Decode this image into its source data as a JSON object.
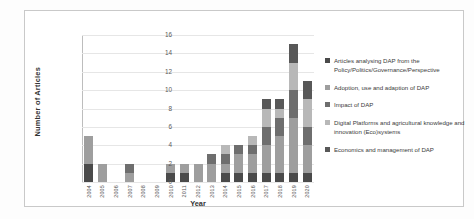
{
  "chart_data": {
    "type": "bar",
    "stacked": true,
    "title": "",
    "xlabel": "Year",
    "ylabel": "Number of Articles",
    "ylim": [
      0,
      16
    ],
    "yticks": [
      0,
      2,
      4,
      6,
      8,
      10,
      12,
      14,
      16
    ],
    "grid": true,
    "legend_position": "right",
    "categories": [
      "2004",
      "2005",
      "2006",
      "2007",
      "2008",
      "2009",
      "2010",
      "2011",
      "2012",
      "2013",
      "2014",
      "2015",
      "2016",
      "2017",
      "2018",
      "2019",
      "2020"
    ],
    "series": [
      {
        "name": "Articles analysing DAP from the Policy/Politics/Governance/Perspective",
        "color": "#4a4a4a",
        "values": [
          2,
          0,
          0,
          0,
          0,
          0,
          1,
          1,
          0,
          0,
          1,
          1,
          1,
          1,
          1,
          1,
          1
        ]
      },
      {
        "name": "Adoption, use and adaption of DAP",
        "color": "#9e9e9e",
        "values": [
          3,
          2,
          0,
          1,
          0,
          0,
          1,
          1,
          2,
          2,
          1,
          2,
          2,
          3,
          4,
          6,
          3
        ]
      },
      {
        "name": "Impact of DAP",
        "color": "#6e6e6e",
        "values": [
          0,
          0,
          0,
          1,
          0,
          0,
          0,
          0,
          0,
          1,
          1,
          1,
          1,
          2,
          2,
          3,
          2
        ]
      },
      {
        "name": "Digital Platforms and agricultural knowledge and innovation (Eco)systems",
        "color": "#b8b8b8",
        "values": [
          0,
          0,
          0,
          0,
          0,
          0,
          0,
          0,
          0,
          0,
          1,
          0,
          1,
          2,
          1,
          3,
          3
        ]
      },
      {
        "name": "Economics and management of DAP",
        "color": "#585858",
        "values": [
          0,
          0,
          0,
          0,
          0,
          0,
          0,
          0,
          0,
          0,
          0,
          0,
          0,
          1,
          1,
          2,
          2
        ]
      }
    ],
    "totals": [
      5,
      2,
      0,
      2,
      0,
      0,
      2,
      2,
      2,
      3,
      4,
      4,
      5,
      9,
      9,
      15,
      11
    ]
  }
}
